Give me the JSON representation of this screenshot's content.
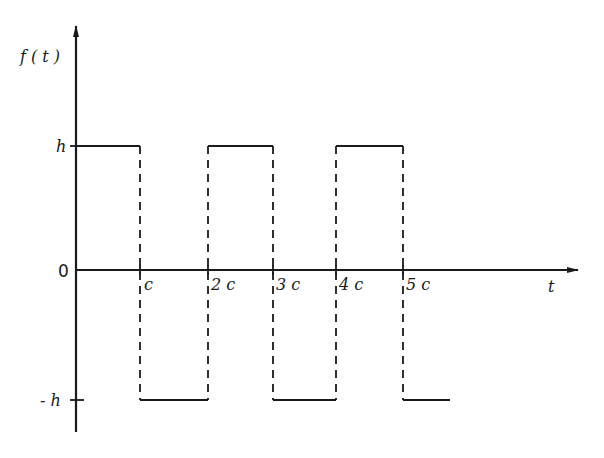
{
  "diagram": {
    "type": "square-wave",
    "y_axis_label": "f ( t )",
    "x_axis_label": "t",
    "y_ticks": [
      {
        "label": "h",
        "value": 1
      },
      {
        "label": "0",
        "value": 0
      },
      {
        "label": "- h",
        "value": -1
      }
    ],
    "x_ticks": [
      {
        "label": "c",
        "value": 1
      },
      {
        "label": "2 c",
        "value": 2
      },
      {
        "label": "3 c",
        "value": 3
      },
      {
        "label": "4 c",
        "value": 4
      },
      {
        "label": "5 c",
        "value": 5
      }
    ],
    "segments": [
      {
        "from": 0,
        "to": 1,
        "level": "h"
      },
      {
        "from": 1,
        "to": 2,
        "level": "-h"
      },
      {
        "from": 2,
        "to": 3,
        "level": "h"
      },
      {
        "from": 3,
        "to": 4,
        "level": "-h"
      },
      {
        "from": 4,
        "to": 5,
        "level": "h"
      },
      {
        "from": 5,
        "to": 5.7,
        "level": "-h"
      }
    ],
    "transitions_style": "dashed",
    "line_color": "#1a1a1a"
  }
}
